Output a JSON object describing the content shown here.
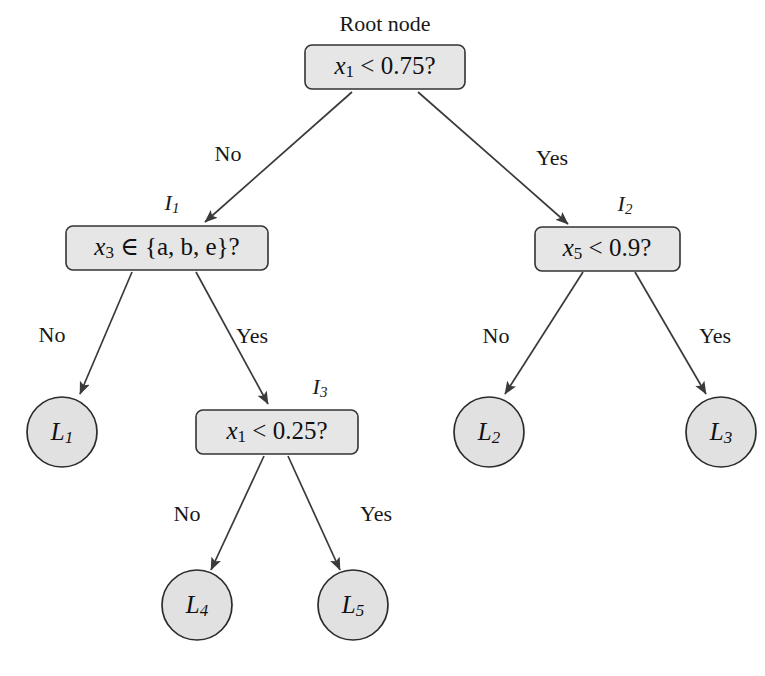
{
  "figure": {
    "type": "decision-tree-diagram",
    "background_color": "#ffffff",
    "node_fill_color": "#e6e6e6",
    "node_stroke_color": "#333333",
    "edge_color": "#3a3a3a"
  },
  "root_caption": "Root node",
  "nodes": {
    "root": {
      "id": "root",
      "kind": "internal",
      "caption": "Root node",
      "condition_var": "x",
      "condition_sub": "1",
      "condition_rest": " < 0.75?",
      "condition_full": "x1 < 0.75?"
    },
    "i1": {
      "id": "I1",
      "kind": "internal",
      "caption_sym": "I",
      "caption_sub": "1",
      "caption_full": "I1",
      "condition_var": "x",
      "condition_sub": "3",
      "condition_rest": " ∈ {a, b, e}?",
      "condition_full": "x3 ∈ {a, b, e}?"
    },
    "i2": {
      "id": "I2",
      "kind": "internal",
      "caption_sym": "I",
      "caption_sub": "2",
      "caption_full": "I2",
      "condition_var": "x",
      "condition_sub": "5",
      "condition_rest": " < 0.9?",
      "condition_full": "x5 < 0.9?"
    },
    "i3": {
      "id": "I3",
      "kind": "internal",
      "caption_sym": "I",
      "caption_sub": "3",
      "caption_full": "I3",
      "condition_var": "x",
      "condition_sub": "1",
      "condition_rest": " < 0.25?",
      "condition_full": "x1 < 0.25?"
    },
    "l1": {
      "id": "L1",
      "kind": "leaf",
      "sym": "L",
      "sub": "1",
      "label_full": "L1"
    },
    "l2": {
      "id": "L2",
      "kind": "leaf",
      "sym": "L",
      "sub": "2",
      "label_full": "L2"
    },
    "l3": {
      "id": "L3",
      "kind": "leaf",
      "sym": "L",
      "sub": "3",
      "label_full": "L3"
    },
    "l4": {
      "id": "L4",
      "kind": "leaf",
      "sym": "L",
      "sub": "4",
      "label_full": "L4"
    },
    "l5": {
      "id": "L5",
      "kind": "leaf",
      "sym": "L",
      "sub": "5",
      "label_full": "L5"
    }
  },
  "edges": [
    {
      "from": "root",
      "to": "i1",
      "label": "No"
    },
    {
      "from": "root",
      "to": "i2",
      "label": "Yes"
    },
    {
      "from": "i1",
      "to": "l1",
      "label": "No"
    },
    {
      "from": "i1",
      "to": "i3",
      "label": "Yes"
    },
    {
      "from": "i2",
      "to": "l2",
      "label": "No"
    },
    {
      "from": "i2",
      "to": "l3",
      "label": "Yes"
    },
    {
      "from": "i3",
      "to": "l4",
      "label": "No"
    },
    {
      "from": "i3",
      "to": "l5",
      "label": "Yes"
    }
  ],
  "edge_labels": {
    "root_left": "No",
    "root_right": "Yes",
    "i1_left": "No",
    "i1_right": "Yes",
    "i2_left": "No",
    "i2_right": "Yes",
    "i3_left": "No",
    "i3_right": "Yes"
  }
}
